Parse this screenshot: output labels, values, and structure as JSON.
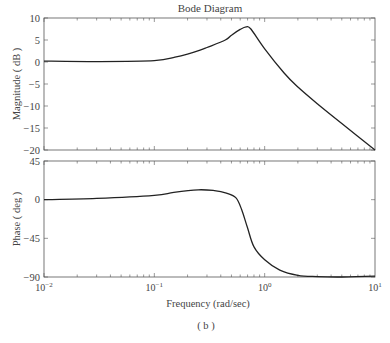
{
  "chart_data": {
    "type": "line",
    "title": "Bode Diagram",
    "caption": "( b )",
    "xlabel": "Frequency (rad/sec)",
    "xscale": "log",
    "xlim": [
      0.01,
      10
    ],
    "xticks": [
      0.01,
      0.1,
      1,
      10
    ],
    "xtick_labels": [
      "10^-2",
      "10^-1",
      "10^0",
      "10^1"
    ],
    "grid": false,
    "subplots": [
      {
        "name": "magnitude",
        "ylabel": "Magnitude (dB)",
        "ylim": [
          -20,
          10
        ],
        "yticks": [
          10,
          5,
          0,
          -5,
          -10,
          -15,
          -20
        ],
        "x": [
          0.01,
          0.03,
          0.1,
          0.154,
          0.2,
          0.26,
          0.3,
          0.44,
          0.5,
          0.6,
          0.68,
          0.75,
          1.0,
          1.5,
          2.0,
          3.0,
          5.0,
          10
        ],
        "values": [
          0.2,
          0.1,
          0.3,
          1.1,
          1.8,
          2.7,
          3.3,
          5.0,
          6.1,
          7.4,
          8.0,
          7.5,
          3.0,
          -2.5,
          -5.7,
          -9.5,
          -14.0,
          -20.0
        ]
      },
      {
        "name": "phase",
        "ylabel": "Phase (deg)",
        "ylim": [
          -90,
          45
        ],
        "yticks": [
          45,
          0,
          -45,
          -90
        ],
        "x": [
          0.01,
          0.03,
          0.1,
          0.15,
          0.25,
          0.35,
          0.45,
          0.55,
          0.62,
          0.7,
          0.8,
          1.0,
          1.37,
          2.0,
          3.0,
          5.0,
          10
        ],
        "values": [
          0,
          1.5,
          5,
          8.5,
          11.5,
          10.5,
          7.5,
          2,
          -12,
          -33,
          -55,
          -70,
          -82,
          -88,
          -89.5,
          -90,
          -89
        ]
      }
    ]
  },
  "labels": {
    "title": "Bode Diagram",
    "mag_ylabel": "Magnitude ( dB )",
    "phase_ylabel": "Phase ( deg )",
    "xlabel": "Frequency  (rad/sec)",
    "caption": "( b )",
    "mag_ticks": [
      "10",
      "5",
      "0",
      "-5",
      "-10",
      "-15",
      "-20"
    ],
    "phase_ticks": [
      "45",
      "0",
      "-45",
      "-90"
    ],
    "x_base": "10",
    "x_exps": [
      "-2",
      "-1",
      "0",
      "1"
    ]
  },
  "colors": {
    "line": "#222222",
    "axis": "#555555",
    "text": "#444444"
  }
}
